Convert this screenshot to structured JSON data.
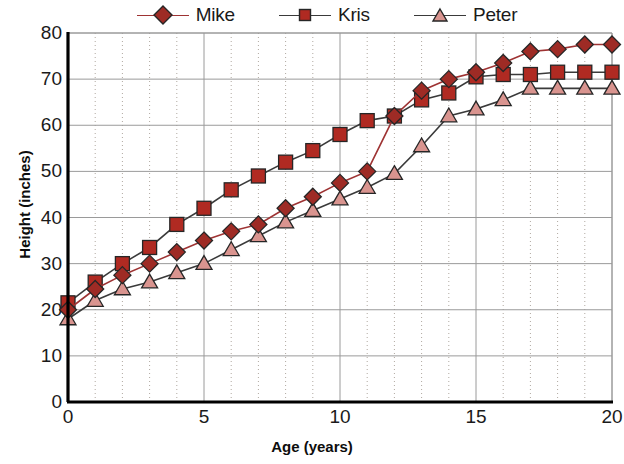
{
  "chart_data": {
    "type": "line",
    "title": "",
    "xlabel": "Age (years)",
    "ylabel": "Height (inches)",
    "xlim": [
      0,
      20
    ],
    "ylim": [
      0,
      80
    ],
    "xticks": [
      0,
      5,
      10,
      15,
      20
    ],
    "yticks": [
      0,
      10,
      20,
      30,
      40,
      50,
      60,
      70,
      80
    ],
    "x_minor_step": 1,
    "grid": "horizontal solid at each 10; vertical dotted at each 1; vertical solid at each 5",
    "legend_position": "top-center",
    "x": [
      0,
      1,
      2,
      3,
      4,
      5,
      6,
      7,
      8,
      9,
      10,
      11,
      12,
      13,
      14,
      15,
      16,
      17,
      18,
      19,
      20
    ],
    "series": [
      {
        "name": "Mike",
        "marker": "diamond",
        "color": "#9e2b25",
        "line_color": "#9e3333",
        "values": [
          20,
          24.5,
          27.5,
          30,
          32.5,
          35,
          37,
          38.5,
          42,
          44.5,
          47.5,
          50,
          62,
          67.5,
          70,
          71.5,
          73.5,
          76,
          76.5,
          77.5,
          77.5
        ]
      },
      {
        "name": "Kris",
        "marker": "square",
        "color": "#b02a22",
        "line_color": "#3a3a3a",
        "values": [
          21.5,
          26,
          30,
          33.5,
          38.5,
          42,
          46,
          49,
          52,
          54.5,
          58,
          61,
          62,
          65.5,
          67,
          70.5,
          71,
          71,
          71.5,
          71.5,
          71.5
        ]
      },
      {
        "name": "Peter",
        "marker": "triangle",
        "color": "#d9948f",
        "line_color": "#3a3a3a",
        "values": [
          18,
          22,
          24.5,
          26,
          28,
          30,
          33,
          36,
          39,
          41.5,
          44,
          46.5,
          49.5,
          55.5,
          62,
          63.5,
          65.5,
          68,
          68,
          68,
          68
        ]
      }
    ]
  },
  "legend": {
    "entries": [
      {
        "label": "Mike"
      },
      {
        "label": "Kris"
      },
      {
        "label": "Peter"
      }
    ]
  },
  "axes": {
    "y_label": "Height (inches)",
    "x_label": "Age (years)",
    "y_ticks": [
      "80",
      "70",
      "60",
      "50",
      "40",
      "30",
      "20",
      "10",
      "0"
    ],
    "x_ticks": [
      "0",
      "5",
      "10",
      "15",
      "20"
    ]
  },
  "colors": {
    "mike_marker": "#9e2b25",
    "mike_line": "#9e3333",
    "kris_marker": "#b02a22",
    "kris_line": "#3a3a3a",
    "peter_marker": "#d9948f",
    "peter_line": "#3a3a3a",
    "marker_edge": "#262626",
    "axis": "#000000",
    "gridline_major": "#9a9a9a",
    "gridline_minor": "#b0a8a0",
    "text": "#1a1a1a"
  }
}
